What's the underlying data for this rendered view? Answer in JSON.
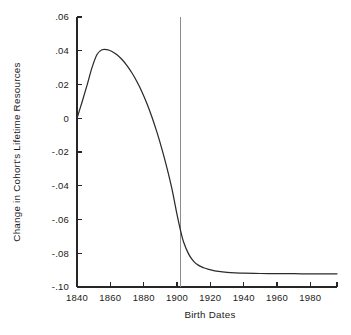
{
  "chart_data": {
    "type": "line",
    "title": "",
    "xlabel": "Birth Dates",
    "ylabel": "Change in Cohort's Lifetime Resources",
    "xlim": [
      1840,
      1996
    ],
    "ylim": [
      -0.1,
      0.06
    ],
    "grid": false,
    "legend": "none",
    "x_ticks": [
      1840,
      1860,
      1880,
      1900,
      1920,
      1940,
      1960,
      1980
    ],
    "x_tick_labels": [
      "1840",
      "1860",
      "1880",
      "1900",
      "1920",
      "1940",
      "1960",
      "1980"
    ],
    "y_ticks": [
      0.06,
      0.04,
      0.02,
      0,
      -0.02,
      -0.04,
      -0.06,
      -0.08,
      -0.1
    ],
    "y_tick_labels": [
      ".06",
      ".04",
      ".02",
      "0",
      "-.02",
      "-.04",
      "-.06",
      "-.08",
      "-.10"
    ],
    "annotations": [
      {
        "name": "vertical-reference-line",
        "type": "vline",
        "x": 1902,
        "y_from": -0.1,
        "y_to": 0.06,
        "color": "#8c8c8c"
      }
    ],
    "series": [
      {
        "name": "Change in Cohort's Lifetime Resources",
        "color": "#2b2b2b",
        "x": [
          1840,
          1843,
          1846,
          1849,
          1852,
          1855,
          1858,
          1861,
          1864,
          1867,
          1870,
          1873,
          1876,
          1879,
          1882,
          1885,
          1888,
          1891,
          1894,
          1897,
          1900,
          1902,
          1904,
          1907,
          1910,
          1913,
          1916,
          1919,
          1922,
          1925,
          1930,
          1935,
          1940,
          1950,
          1960,
          1970,
          1980,
          1990,
          1996
        ],
        "y": [
          0.0,
          0.0095,
          0.0195,
          0.03,
          0.0378,
          0.0406,
          0.0407,
          0.0396,
          0.0376,
          0.0348,
          0.0312,
          0.0268,
          0.0216,
          0.0156,
          0.0086,
          0.0006,
          -0.0084,
          -0.0184,
          -0.0295,
          -0.042,
          -0.057,
          -0.066,
          -0.0735,
          -0.0805,
          -0.0848,
          -0.0872,
          -0.0886,
          -0.0896,
          -0.0903,
          -0.0908,
          -0.0913,
          -0.0916,
          -0.0918,
          -0.092,
          -0.0921,
          -0.0921,
          -0.0922,
          -0.0922,
          -0.0922
        ]
      }
    ]
  },
  "axis": {
    "y_title": "Change in Cohort's Lifetime Resources",
    "x_title": "Birth Dates"
  }
}
